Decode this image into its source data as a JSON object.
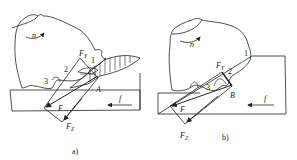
{
  "figure": {
    "panels": [
      {
        "id": "a",
        "caption": "a)",
        "labels": {
          "rotation": "n",
          "force_y": "FY",
          "force_y_main": "F",
          "force_y_sub": "Y",
          "force_z_main": "F",
          "force_z_sub": "Z",
          "resultant": "F",
          "point": "A",
          "feed": "f",
          "grain_1": "1",
          "grain_2": "2",
          "grain_3": "3"
        }
      },
      {
        "id": "b",
        "caption": "b)",
        "labels": {
          "rotation": "n",
          "force_y_main": "F",
          "force_y_sub": "Y",
          "force_z_main": "F",
          "force_z_sub": "Z",
          "resultant": "F",
          "point": "B",
          "feed": "f",
          "grain_1": "1",
          "grain_2": "2",
          "grain_3": "3"
        }
      }
    ],
    "colors": {
      "line": "#222222",
      "background": "#ffffff"
    }
  }
}
